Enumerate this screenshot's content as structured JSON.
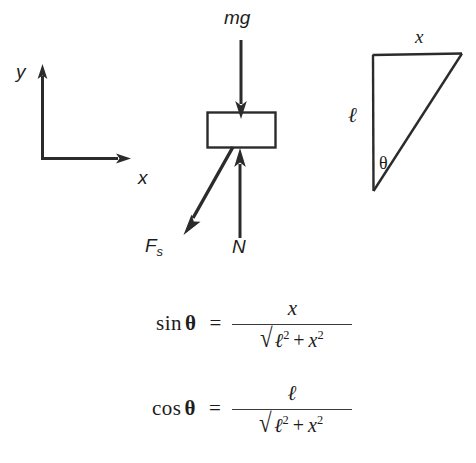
{
  "figure": {
    "title_present": false,
    "axes": {
      "x_label": "x",
      "y_label": "y",
      "origin": {
        "x": 42,
        "y": 158
      },
      "x_tip": {
        "x": 130,
        "y": 158
      },
      "y_tip": {
        "x": 42,
        "y": 66
      }
    },
    "block": {
      "name": "mass-block",
      "left": 207,
      "top": 112,
      "width": 69,
      "height": 36
    },
    "forces": [
      {
        "name": "weight-vector",
        "label": "mg",
        "direction": "down",
        "from": {
          "x": 241,
          "y": 40
        },
        "to": {
          "x": 241,
          "y": 116
        },
        "label_pos": {
          "x": 226,
          "y": 10
        }
      },
      {
        "name": "normal-force-vector",
        "label": "N",
        "direction": "up",
        "from": {
          "x": 240,
          "y": 238
        },
        "to": {
          "x": 240,
          "y": 150
        },
        "label_pos": {
          "x": 233,
          "y": 238
        }
      },
      {
        "name": "spring-force-vector",
        "label": "F",
        "label_sub": "s",
        "direction": "down-left",
        "from": {
          "x": 233,
          "y": 148
        },
        "to": {
          "x": 186,
          "y": 233
        },
        "label_pos": {
          "x": 146,
          "y": 236
        }
      }
    ],
    "triangle": {
      "name": "geometry-triangle",
      "vertices": {
        "top_left": {
          "x": 372,
          "y": 55
        },
        "top_right": {
          "x": 462,
          "y": 53
        },
        "bottom_left": {
          "x": 373,
          "y": 191
        }
      },
      "labels": {
        "horizontal_side": "x",
        "vertical_side": "ℓ",
        "angle": "θ"
      }
    },
    "colors": {
      "ink": "#1c1c1c",
      "line": "#2b2b2b",
      "background": "#ffffff",
      "rule": "#3a3a3a"
    }
  },
  "equations": [
    {
      "name": "sine-identity",
      "lhs": "sin",
      "lhs_angle": "θ",
      "relation": "=",
      "numerator": "x",
      "denominator": {
        "radical": true,
        "term1": "ℓ",
        "term1_exp": "2",
        "operator": "+",
        "term2": "x",
        "term2_exp": "2"
      },
      "plain": "sin θ = x / √(ℓ² + x²)"
    },
    {
      "name": "cosine-identity",
      "lhs": "cos",
      "lhs_angle": "θ",
      "relation": "=",
      "numerator": "ℓ",
      "denominator": {
        "radical": true,
        "term1": "ℓ",
        "term1_exp": "2",
        "operator": "+",
        "term2": "x",
        "term2_exp": "2"
      },
      "plain": "cos θ = ℓ / √(ℓ² + x²)"
    }
  ]
}
